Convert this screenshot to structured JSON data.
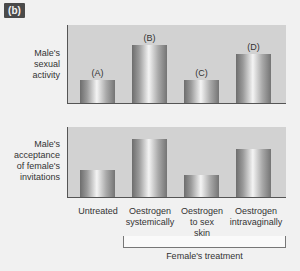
{
  "panel_tag": "(b)",
  "chart_data": [
    {
      "type": "bar",
      "title": "",
      "ylabel": "Male's\nsexual\nactivity",
      "xlabel": "",
      "categories": [
        "Untreated",
        "Oestrogen systemically",
        "Oestrogen to sex skin",
        "Oestrogen intravaginally"
      ],
      "bar_labels": [
        "(A)",
        "(B)",
        "(C)",
        "(D)"
      ],
      "values": [
        23,
        58,
        23,
        49
      ],
      "ylim": [
        0,
        78
      ],
      "grid": false
    },
    {
      "type": "bar",
      "title": "",
      "ylabel": "Male's\nacceptance\nof female's\ninvitations",
      "xlabel": "Female's treatment",
      "categories": [
        "Untreated",
        "Oestrogen systemically",
        "Oestrogen to sex skin",
        "Oestrogen intravaginally"
      ],
      "values": [
        27,
        58,
        22,
        48
      ],
      "ylim": [
        0,
        70
      ],
      "grid": false
    }
  ],
  "x_tick_labels": [
    "Untreated",
    "Oestrogen\nsystemically",
    "Oestrogen\nto sex\nskin",
    "Oestrogen\nintravaginally"
  ],
  "bracket_label": "Female's treatment",
  "colors": {
    "panel_bg": "#d2d2d2",
    "page_bg": "#f1f1f1",
    "axis": "#555555",
    "tag_bg": "#4a4a4a"
  }
}
